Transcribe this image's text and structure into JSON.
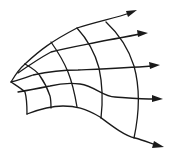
{
  "diagram": {
    "title": "",
    "streamline_count": 5,
    "arc_count": 5,
    "streamlines_have_arrowheads": true,
    "arrow_direction": "right",
    "line_color": "#1a1a1a",
    "background_color": "#ffffff",
    "labels": []
  }
}
